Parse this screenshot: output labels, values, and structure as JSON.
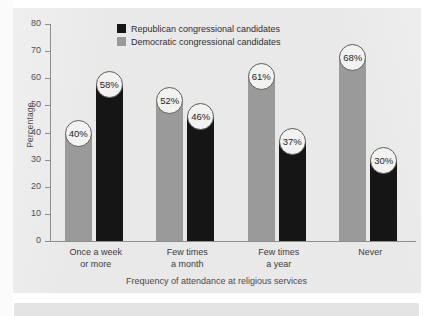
{
  "chart_data": {
    "type": "bar",
    "title": "",
    "xlabel": "Frequency of attendance at religious services",
    "ylabel": "Percentage",
    "ylim": [
      0,
      80
    ],
    "yticks": [
      0,
      10,
      20,
      30,
      40,
      50,
      60,
      70,
      80
    ],
    "grid": false,
    "legend_position": "top-center",
    "categories": [
      "Once a week\nor more",
      "Few times\na month",
      "Few times\na year",
      "Never"
    ],
    "categories_lines": [
      [
        "Once a week",
        "or more"
      ],
      [
        "Few times",
        "a month"
      ],
      [
        "Few times",
        "a year"
      ],
      [
        "Never",
        ""
      ]
    ],
    "series": [
      {
        "name": "Republican congressional candidates",
        "color": "#151515",
        "values": [
          58,
          46,
          37,
          30
        ],
        "labels": [
          "58%",
          "46%",
          "37%",
          "30%"
        ]
      },
      {
        "name": "Democratic congressional candidates",
        "color": "#9a9a9a",
        "values": [
          40,
          52,
          61,
          68
        ],
        "labels": [
          "40%",
          "52%",
          "61%",
          "68%"
        ]
      }
    ],
    "series_draw_order": [
      "Democratic congressional candidates",
      "Republican congressional candidates"
    ]
  },
  "axis": {
    "y_label": "Percentage",
    "y_ticks": [
      "80",
      "70",
      "60",
      "50",
      "40",
      "30",
      "20",
      "10",
      "0"
    ],
    "x_title": "Frequency of attendance at religious services"
  },
  "legend": {
    "items": [
      {
        "label": "Republican congressional candidates",
        "swatch": "rep"
      },
      {
        "label": "Democratic congressional candidates",
        "swatch": "dem"
      }
    ]
  },
  "colors": {
    "republican": "#151515",
    "democratic": "#9a9a9a",
    "panel": "#e9e9e9",
    "axis": "#8d8d8d",
    "text": "#3c3c3c"
  }
}
